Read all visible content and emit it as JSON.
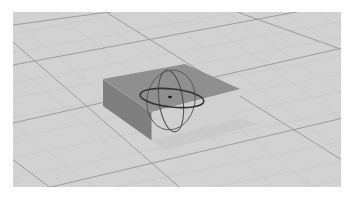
{
  "viewport": {
    "name": "3D perspective viewport",
    "background_color": "#d2d2d2",
    "grid": {
      "major_color": "#9a9a9a",
      "minor_color": "#c8c8c8"
    }
  },
  "scene": {
    "object": {
      "type": "box",
      "top_face_color": "#8e8e8e",
      "left_face_color": "#7e7e7e",
      "right_face_color": "#cfcfcf"
    },
    "gizmo": {
      "type": "rotate-gizmo",
      "ring_color": "#3a3a3a",
      "center_color": "#222222"
    }
  }
}
